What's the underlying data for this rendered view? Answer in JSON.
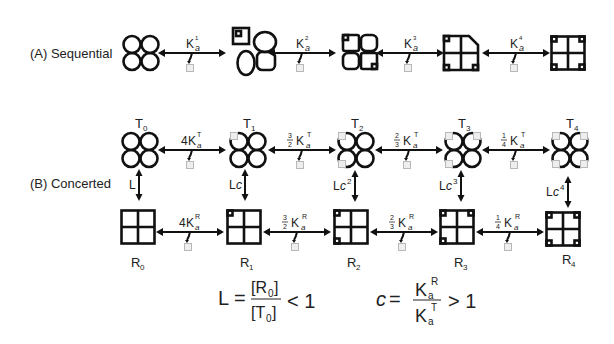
{
  "panel_a": {
    "label": "(A)  Sequential",
    "steps": [
      {
        "k": "K",
        "sub": "a",
        "sup": "1"
      },
      {
        "k": "K",
        "sub": "a",
        "sup": "2"
      },
      {
        "k": "K",
        "sub": "a",
        "sup": "3"
      },
      {
        "k": "K",
        "sub": "a",
        "sup": "4"
      }
    ]
  },
  "panel_b": {
    "label": "(B)  Concerted",
    "t_states": [
      "T",
      "T",
      "T",
      "T",
      "T"
    ],
    "t_subs": [
      "0",
      "1",
      "2",
      "3",
      "4"
    ],
    "r_states": [
      "R",
      "R",
      "R",
      "R",
      "R"
    ],
    "r_subs": [
      "0",
      "1",
      "2",
      "3",
      "4"
    ],
    "t_steps": [
      {
        "coef": "4",
        "num": "",
        "den": "",
        "k": "K",
        "sub": "a",
        "sup": "T"
      },
      {
        "coef": "",
        "num": "3",
        "den": "2",
        "k": "K",
        "sub": "a",
        "sup": "T"
      },
      {
        "coef": "",
        "num": "2",
        "den": "3",
        "k": "K",
        "sub": "a",
        "sup": "T"
      },
      {
        "coef": "",
        "num": "1",
        "den": "4",
        "k": "K",
        "sub": "a",
        "sup": "T"
      }
    ],
    "r_steps": [
      {
        "coef": "4",
        "num": "",
        "den": "",
        "k": "K",
        "sub": "a",
        "sup": "R"
      },
      {
        "coef": "",
        "num": "3",
        "den": "2",
        "k": "K",
        "sub": "a",
        "sup": "R"
      },
      {
        "coef": "",
        "num": "2",
        "den": "3",
        "k": "K",
        "sub": "a",
        "sup": "R"
      },
      {
        "coef": "",
        "num": "1",
        "den": "4",
        "k": "K",
        "sub": "a",
        "sup": "R"
      }
    ],
    "vertical": [
      {
        "base": "L",
        "c": "",
        "pow": ""
      },
      {
        "base": "L",
        "c": "c",
        "pow": ""
      },
      {
        "base": "L",
        "c": "c",
        "pow": "2"
      },
      {
        "base": "L",
        "c": "c",
        "pow": "3"
      },
      {
        "base": "L",
        "c": "c",
        "pow": "4"
      }
    ]
  },
  "equations": {
    "L": {
      "lhs": "L =",
      "num": "[R",
      "num_sub": "0",
      "num_close": "]",
      "den": "[T",
      "den_sub": "0",
      "den_close": "]",
      "rel": "< 1"
    },
    "c": {
      "lhs": "c",
      "eq": "=",
      "num": "K",
      "num_sub": "a",
      "num_sup": "R",
      "den": "K",
      "den_sub": "a",
      "den_sup": "T",
      "rel": "> 1"
    }
  },
  "colors": {
    "stroke": "#111111",
    "ligand_fill": "#eeeeee",
    "ligand_stroke": "#b8b8b8",
    "text": "#222222"
  }
}
